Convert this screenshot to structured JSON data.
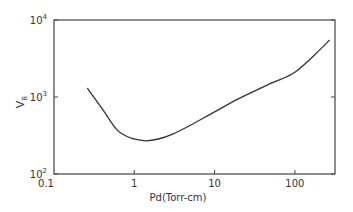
{
  "chart_data": {
    "type": "line",
    "title": "",
    "xlabel": "Pd(Torr-cm)",
    "ylabel": "V_B",
    "ylabel_main": "V",
    "ylabel_sub": "B",
    "xscale": "log",
    "yscale": "log",
    "xlim": [
      0.1,
      316
    ],
    "ylim": [
      100,
      10000
    ],
    "x_ticks": [
      "0.1",
      "1",
      "10",
      "100"
    ],
    "y_ticks": [
      {
        "base": "10",
        "exp": "2"
      },
      {
        "base": "10",
        "exp": "3"
      },
      {
        "base": "10",
        "exp": "4"
      }
    ],
    "grid": false,
    "series": [
      {
        "name": "Breakdown voltage",
        "x": [
          0.26,
          0.4,
          0.6,
          0.8,
          1.0,
          1.4,
          2.0,
          3.0,
          5.0,
          10,
          20,
          50,
          100,
          200,
          270
        ],
        "values": [
          1300,
          700,
          380,
          310,
          285,
          270,
          285,
          330,
          430,
          640,
          950,
          1500,
          2100,
          4000,
          5500
        ]
      }
    ]
  }
}
